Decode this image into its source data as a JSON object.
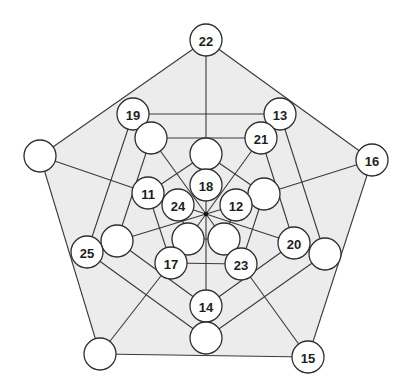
{
  "diagram": {
    "type": "graph",
    "background": "#ffffff",
    "fill_color": "#ececec",
    "edge_color": "#3a3a3a",
    "node_fill": "#ffffff",
    "node_radius": 16,
    "outer_polygon": [
      "Lout",
      "n22",
      "n16",
      "n15",
      "H"
    ],
    "nodes": [
      {
        "id": "n22",
        "label": "22",
        "x": 206,
        "y": 40
      },
      {
        "id": "n19",
        "label": "19",
        "x": 133,
        "y": 114
      },
      {
        "id": "n13",
        "label": "13",
        "x": 280,
        "y": 114
      },
      {
        "id": "A",
        "label": "",
        "x": 151,
        "y": 138
      },
      {
        "id": "n21",
        "label": "21",
        "x": 261,
        "y": 138
      },
      {
        "id": "Lout",
        "label": "",
        "x": 40,
        "y": 156
      },
      {
        "id": "n16",
        "label": "16",
        "x": 372,
        "y": 160
      },
      {
        "id": "B",
        "label": "",
        "x": 206,
        "y": 154
      },
      {
        "id": "n18",
        "label": "18",
        "x": 206,
        "y": 185
      },
      {
        "id": "n11",
        "label": "11",
        "x": 148,
        "y": 193
      },
      {
        "id": "C",
        "label": "",
        "x": 264,
        "y": 194
      },
      {
        "id": "n24",
        "label": "24",
        "x": 178,
        "y": 205
      },
      {
        "id": "n12",
        "label": "12",
        "x": 236,
        "y": 205
      },
      {
        "id": "D",
        "label": "",
        "x": 117,
        "y": 241
      },
      {
        "id": "n20",
        "label": "20",
        "x": 294,
        "y": 243
      },
      {
        "id": "E",
        "label": "",
        "x": 188,
        "y": 239
      },
      {
        "id": "F",
        "label": "",
        "x": 224,
        "y": 239
      },
      {
        "id": "n25",
        "label": "25",
        "x": 87,
        "y": 252
      },
      {
        "id": "G",
        "label": "",
        "x": 325,
        "y": 254
      },
      {
        "id": "n17",
        "label": "17",
        "x": 171,
        "y": 263
      },
      {
        "id": "n23",
        "label": "23",
        "x": 241,
        "y": 264
      },
      {
        "id": "n14",
        "label": "14",
        "x": 206,
        "y": 306
      },
      {
        "id": "H",
        "label": "",
        "x": 100,
        "y": 354
      },
      {
        "id": "I",
        "label": "",
        "x": 206,
        "y": 338
      },
      {
        "id": "n15",
        "label": "15",
        "x": 308,
        "y": 357
      }
    ],
    "hub": {
      "x": 206,
      "y": 214
    },
    "edges": [
      [
        "n22",
        "Lout"
      ],
      [
        "n22",
        "n16"
      ],
      [
        "Lout",
        "H"
      ],
      [
        "H",
        "n15"
      ],
      [
        "n16",
        "n15"
      ],
      [
        "n22",
        "B"
      ],
      [
        "Lout",
        "n11"
      ],
      [
        "n16",
        "C"
      ],
      [
        "H",
        "n17"
      ],
      [
        "n15",
        "n23"
      ],
      [
        "n19",
        "n13"
      ],
      [
        "n19",
        "n25"
      ],
      [
        "n13",
        "G"
      ],
      [
        "A",
        "n21"
      ],
      [
        "A",
        "D"
      ],
      [
        "n21",
        "n20"
      ],
      [
        "B",
        "n11"
      ],
      [
        "B",
        "C"
      ],
      [
        "n11",
        "n17"
      ],
      [
        "C",
        "n23"
      ],
      [
        "n25",
        "I"
      ],
      [
        "G",
        "I"
      ],
      [
        "D",
        "n14"
      ],
      [
        "n20",
        "n14"
      ],
      [
        "n14",
        "I"
      ],
      [
        "n17",
        "n23"
      ],
      [
        "E",
        "F"
      ],
      [
        "n24",
        "E"
      ],
      [
        "n12",
        "F"
      ],
      [
        "hub",
        "n18"
      ],
      [
        "hub",
        "n14"
      ],
      [
        "hub",
        "D"
      ],
      [
        "hub",
        "n20"
      ],
      [
        "hub",
        "n24"
      ],
      [
        "hub",
        "n12"
      ],
      [
        "hub",
        "E"
      ],
      [
        "hub",
        "F"
      ],
      [
        "hub",
        "A"
      ],
      [
        "hub",
        "n21"
      ],
      [
        "n18",
        "B"
      ]
    ]
  }
}
